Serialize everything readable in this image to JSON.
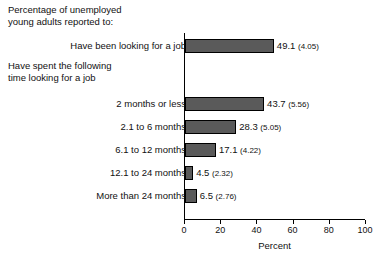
{
  "header": {
    "main_text": "Percentage of unemployed\nyoung adults reported to:",
    "sub_text": "Have spent the following\ntime looking for a job"
  },
  "axis": {
    "xlabel": "Percent",
    "tick_labels": [
      "0",
      "20",
      "40",
      "60",
      "80",
      "100"
    ],
    "tick_values": [
      0,
      20,
      40,
      60,
      80,
      100
    ]
  },
  "style": {
    "bar_fill": "#5a5a5a",
    "bar_stroke": "#000000",
    "text_color": "#111111"
  },
  "chart_data": {
    "type": "bar",
    "orientation": "horizontal",
    "title": "Percentage of unemployed young adults reported to:",
    "subtitle": "Have spent the following time looking for a job",
    "xlabel": "Percent",
    "ylabel": "",
    "xlim": [
      0,
      100
    ],
    "grid": false,
    "legend": null,
    "categories": [
      "Have been looking for a job",
      "2 months or less",
      "2.1 to 6 months",
      "6.1 to 12 months",
      "12.1 to 24 months",
      "More than 24 months"
    ],
    "values": [
      49.1,
      43.7,
      28.3,
      17.1,
      4.5,
      6.5
    ],
    "standard_errors": [
      4.05,
      5.56,
      5.05,
      4.22,
      2.32,
      2.76
    ],
    "data_labels": [
      "49.1 (4.05)",
      "43.7 (5.56)",
      "28.3 (5.05)",
      "17.1 (4.22)",
      "4.5 (2.32)",
      "6.5 (2.76)"
    ],
    "rows": [
      {
        "label": "Have been looking for a job",
        "value": 49.1,
        "se": 4.05,
        "value_text": "49.1",
        "se_text": "(4.05)",
        "top": 39
      },
      {
        "label": "2 months or less",
        "value": 43.7,
        "se": 5.56,
        "value_text": "43.7",
        "se_text": "(5.56)",
        "top": 97
      },
      {
        "label": "2.1 to 6 months",
        "value": 28.3,
        "se": 5.05,
        "value_text": "28.3",
        "se_text": "(5.05)",
        "top": 120
      },
      {
        "label": "6.1 to 12 months",
        "value": 17.1,
        "se": 4.22,
        "value_text": "17.1",
        "se_text": "(4.22)",
        "top": 143
      },
      {
        "label": "12.1 to 24 months",
        "value": 4.5,
        "se": 2.32,
        "value_text": "4.5",
        "se_text": "(2.32)",
        "top": 166
      },
      {
        "label": "More than 24 months",
        "value": 6.5,
        "se": 2.76,
        "value_text": "6.5",
        "se_text": "(2.76)",
        "top": 189
      }
    ]
  }
}
